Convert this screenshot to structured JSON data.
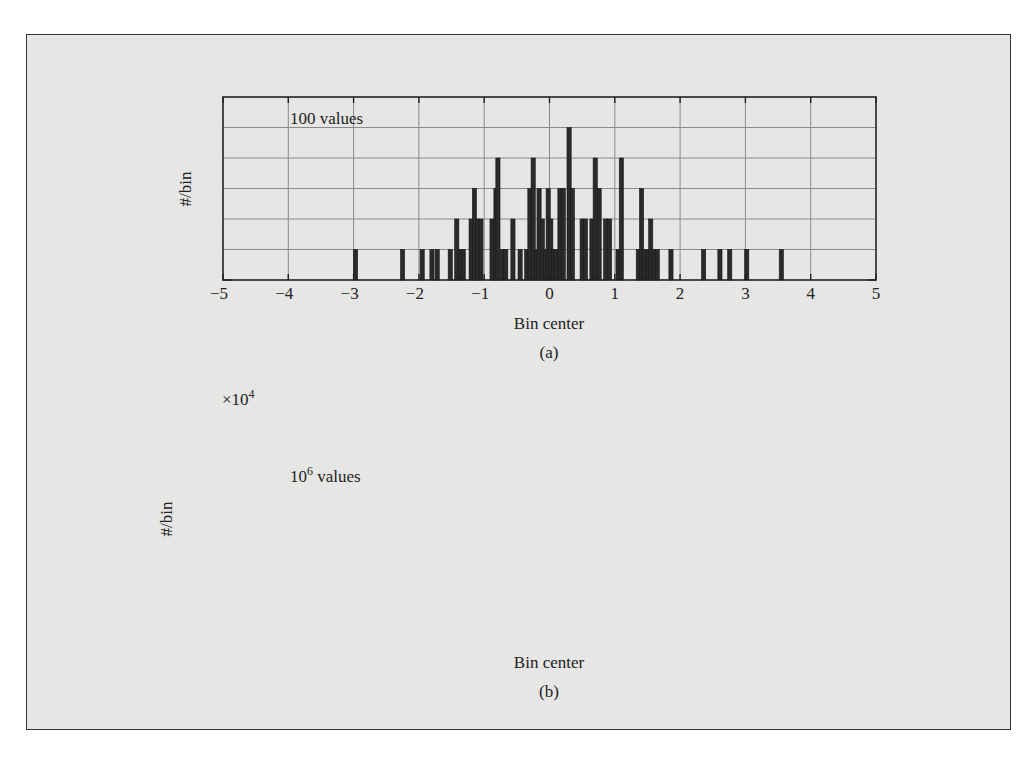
{
  "figure": {
    "panel_a": {
      "caption": "(a)",
      "annotation": "100 values",
      "xlabel": "Bin center",
      "ylabel": "#/bin"
    },
    "panel_b": {
      "caption": "(b)",
      "annotation_base": "10",
      "annotation_exp": "6",
      "annotation_suffix": " values",
      "xlabel": "Bin center",
      "ylabel": "#/bin",
      "multiplier_base": "×10",
      "multiplier_exp": "4"
    }
  },
  "chart_data": [
    {
      "type": "bar",
      "title": "(a)",
      "annotation": "100 values",
      "xlabel": "Bin center",
      "ylabel": "#/bin",
      "xlim": [
        -5,
        5
      ],
      "ylim": [
        0,
        6
      ],
      "xticks": [
        -5,
        -4,
        -3,
        -2,
        -1,
        0,
        1,
        2,
        3,
        4,
        5
      ],
      "yticks": [
        0,
        1,
        2,
        3,
        4,
        5,
        6
      ],
      "grid": true,
      "bars": [
        {
          "x": -2.97,
          "y": 1
        },
        {
          "x": -2.25,
          "y": 1
        },
        {
          "x": -1.95,
          "y": 1
        },
        {
          "x": -1.8,
          "y": 1
        },
        {
          "x": -1.72,
          "y": 1
        },
        {
          "x": -1.52,
          "y": 1
        },
        {
          "x": -1.42,
          "y": 2
        },
        {
          "x": -1.36,
          "y": 1
        },
        {
          "x": -1.32,
          "y": 1
        },
        {
          "x": -1.2,
          "y": 2
        },
        {
          "x": -1.15,
          "y": 3
        },
        {
          "x": -1.1,
          "y": 2
        },
        {
          "x": -1.05,
          "y": 2
        },
        {
          "x": -0.88,
          "y": 2
        },
        {
          "x": -0.82,
          "y": 3
        },
        {
          "x": -0.79,
          "y": 4
        },
        {
          "x": -0.72,
          "y": 1
        },
        {
          "x": -0.67,
          "y": 1
        },
        {
          "x": -0.56,
          "y": 2
        },
        {
          "x": -0.45,
          "y": 1
        },
        {
          "x": -0.35,
          "y": 1
        },
        {
          "x": -0.3,
          "y": 3
        },
        {
          "x": -0.25,
          "y": 4
        },
        {
          "x": -0.2,
          "y": 1
        },
        {
          "x": -0.16,
          "y": 3
        },
        {
          "x": -0.11,
          "y": 2
        },
        {
          "x": -0.06,
          "y": 1
        },
        {
          "x": -0.02,
          "y": 3
        },
        {
          "x": 0.02,
          "y": 2
        },
        {
          "x": 0.06,
          "y": 1
        },
        {
          "x": 0.1,
          "y": 1
        },
        {
          "x": 0.16,
          "y": 3
        },
        {
          "x": 0.21,
          "y": 3
        },
        {
          "x": 0.3,
          "y": 5
        },
        {
          "x": 0.35,
          "y": 3
        },
        {
          "x": 0.5,
          "y": 2
        },
        {
          "x": 0.55,
          "y": 2
        },
        {
          "x": 0.65,
          "y": 2
        },
        {
          "x": 0.7,
          "y": 4
        },
        {
          "x": 0.76,
          "y": 3
        },
        {
          "x": 0.86,
          "y": 2
        },
        {
          "x": 0.92,
          "y": 2
        },
        {
          "x": 1.05,
          "y": 1
        },
        {
          "x": 1.1,
          "y": 4
        },
        {
          "x": 1.36,
          "y": 1
        },
        {
          "x": 1.41,
          "y": 3
        },
        {
          "x": 1.45,
          "y": 1
        },
        {
          "x": 1.51,
          "y": 1
        },
        {
          "x": 1.55,
          "y": 2
        },
        {
          "x": 1.6,
          "y": 1
        },
        {
          "x": 1.65,
          "y": 1
        },
        {
          "x": 1.86,
          "y": 1
        },
        {
          "x": 2.36,
          "y": 1
        },
        {
          "x": 2.61,
          "y": 1
        },
        {
          "x": 2.76,
          "y": 1
        },
        {
          "x": 3.02,
          "y": 1
        },
        {
          "x": 3.55,
          "y": 1
        }
      ]
    },
    {
      "type": "bar",
      "title": "(b)",
      "annotation": "10^6 values",
      "xlabel": "Bin center",
      "ylabel": "#/bin",
      "y_multiplier": "×10^4",
      "xlim": [
        -5,
        5
      ],
      "ylim": [
        0,
        2.2
      ],
      "xticks": [
        -5,
        -4,
        -3,
        -2,
        -1,
        0,
        1,
        2,
        3,
        4,
        5
      ],
      "yticks": [
        0,
        0.5,
        1,
        1.5,
        2
      ],
      "grid": true,
      "distribution": "gaussian",
      "mean": 0,
      "std": 1,
      "peak": 2.0,
      "bin_width": 0.05,
      "x": [
        -4,
        -3.5,
        -3,
        -2.5,
        -2,
        -1.5,
        -1,
        -0.5,
        0,
        0.5,
        1,
        1.5,
        2,
        2.5,
        3,
        3.5,
        4
      ],
      "values": [
        0.0007,
        0.0044,
        0.022,
        0.088,
        0.27,
        0.65,
        1.21,
        1.76,
        2.0,
        1.76,
        1.21,
        0.65,
        0.27,
        0.088,
        0.022,
        0.0044,
        0.0007
      ]
    }
  ]
}
